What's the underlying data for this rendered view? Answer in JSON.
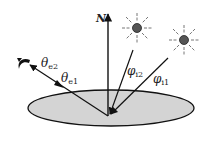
{
  "diagram": {
    "normal_label": "N",
    "incident": [
      {
        "symbol": "φ",
        "sub": "i2"
      },
      {
        "symbol": "φ",
        "sub": "i1"
      }
    ],
    "emission": [
      {
        "symbol": "θ",
        "sub": "e2"
      },
      {
        "symbol": "θ",
        "sub": "e1"
      }
    ],
    "colors": {
      "surface_fill": "#d4d4d4",
      "stroke": "#111111",
      "sun_fill": "#555555",
      "sun_rays": "#777777"
    }
  }
}
